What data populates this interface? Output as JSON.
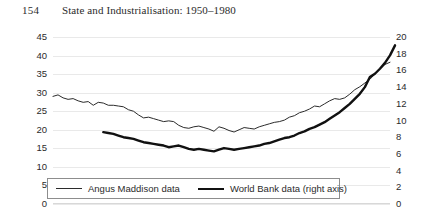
{
  "header": {
    "folio": "154",
    "title": "State and Industrialisation: 1950–1980"
  },
  "legend": {
    "items": [
      {
        "label": "Angus Maddison data",
        "style": "thin",
        "color": "#2b2b2b"
      },
      {
        "label": "World Bank data (right axis)",
        "style": "thick",
        "color": "#111111"
      }
    ]
  },
  "chart_data": {
    "type": "line",
    "title": "",
    "xlabel": "",
    "ylabel": "",
    "grid": true,
    "legend_position": "bottom-left",
    "left_axis": {
      "ticks": [
        45,
        40,
        35,
        30,
        25,
        20,
        15,
        10,
        5,
        0
      ],
      "ylim": [
        0,
        45
      ]
    },
    "right_axis": {
      "ticks": [
        20,
        18,
        16,
        14,
        12,
        10,
        8,
        6,
        4,
        2,
        0
      ],
      "ylim": [
        0,
        20
      ]
    },
    "series": [
      {
        "name": "Angus Maddison data",
        "axis": "left",
        "values": [
          29.0,
          29.4,
          28.6,
          28.2,
          28.4,
          27.8,
          27.4,
          27.6,
          26.6,
          27.4,
          27.2,
          26.6,
          26.6,
          26.4,
          26.2,
          25.4,
          25.0,
          24.0,
          23.2,
          23.4,
          23.0,
          22.6,
          22.2,
          22.4,
          22.2,
          21.2,
          20.6,
          20.4,
          20.8,
          21.0,
          20.6,
          20.2,
          19.6,
          20.8,
          20.4,
          19.8,
          19.4,
          20.0,
          20.6,
          20.4,
          20.2,
          20.8,
          21.2,
          21.6,
          22.0,
          22.2,
          22.6,
          23.4,
          23.8,
          24.6,
          25.0,
          25.6,
          26.4,
          26.2,
          27.0,
          27.8,
          28.4,
          28.2,
          28.6,
          29.6,
          30.8,
          31.6,
          32.6,
          33.6,
          35.0,
          36.4,
          37.6,
          38.2
        ]
      },
      {
        "name": "World Bank data (right axis)",
        "axis": "right",
        "start_index": 10,
        "values": [
          8.6,
          8.5,
          8.4,
          8.2,
          8.0,
          7.9,
          7.8,
          7.6,
          7.4,
          7.3,
          7.2,
          7.1,
          7.0,
          6.8,
          6.9,
          7.0,
          6.8,
          6.6,
          6.5,
          6.6,
          6.5,
          6.4,
          6.3,
          6.5,
          6.7,
          6.6,
          6.5,
          6.6,
          6.7,
          6.8,
          6.9,
          7.0,
          7.2,
          7.3,
          7.5,
          7.7,
          7.9,
          8.0,
          8.2,
          8.5,
          8.7,
          9.0,
          9.2,
          9.5,
          9.8,
          10.2,
          10.6,
          11.0,
          11.5,
          12.0,
          12.6,
          13.2,
          14.0,
          15.2,
          15.6,
          16.2,
          16.9,
          17.8,
          19.0
        ]
      }
    ]
  }
}
